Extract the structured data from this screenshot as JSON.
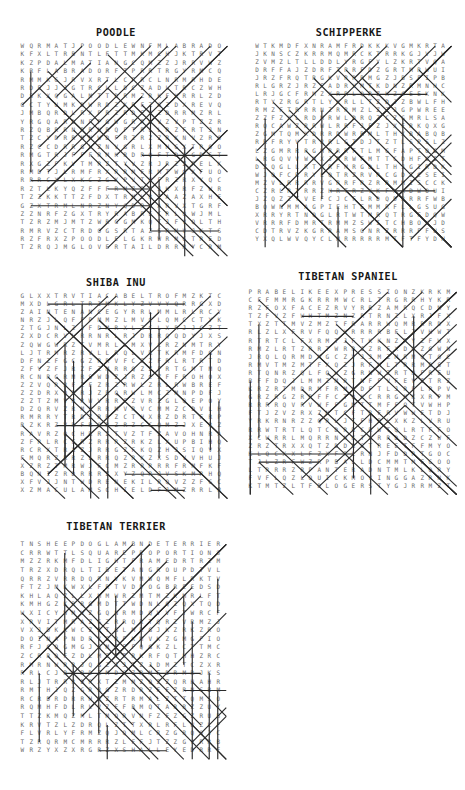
{
  "page": {
    "width": 465,
    "height": 790,
    "background": "#ffffff",
    "kind": "word-search-puzzle-sheet",
    "ink_color": "#2b2b2b",
    "letter_color": "#6a6a6a"
  },
  "puzzles": [
    {
      "id": "poodle",
      "title": "POODLE",
      "x": 8,
      "y": 26,
      "title_width": 216,
      "grid": {
        "left": 10,
        "top": 16,
        "cols": 24,
        "rows": 25,
        "cell_w": 8.55,
        "cell_h": 8.4
      },
      "letters": [
        "WQRMATJPOODLEWNFMLABRADOEXX",
        "KFXLTRBNTLFTTMKMCHJKTRVTAR",
        "KZPDALMATIANGCQMZZJRRVWZ",
        "KRFLABRADORFTPRRTRGYRMCQH",
        "RMMKGJRVXRTLCFRCLNRMRHD",
        "RDEJJJGTRCLLDCZADLTRCZWH",
        "DSKXQGALMTTDRMZRKFKRRLZD",
        "GCTYUMKDWRDZKRFZGZDXR",
        "JMBQRDLRXPRZRDFXZDRRMZR",
        "YRGQARDNFPGWGRRWVZVPTZZR",
        "RZQBRRNRRNRQFTRLLRZFRT",
        "TZCYDRRMNWDFRZRZZRKNVZR",
        "RZCCDRRGLZNVGRLXMHGXTR",
        "RMGTRJFFFRMKRDRQFTDJGDST",
        "RXGZFKVTMRZTYVZRJRZZ",
        "RMDTJLRMFRXRRMFRMTWGX",
        "RRRCXLXKCZGXPVTHFRZRX",
        "RZTLKYQZFFFRMZRTJKXRFZWR",
        "TZZKKTTZFDXTRMLRZAAZAXH",
        "GZXTRMLNRZNYQDRGARVXTGR",
        "ZZNRFZGXTRYRABRECRLQWJM",
        "TZRZMJMTZWRGGMKQTJFVQLT",
        "RMRVZCTRDOGSRTAZSRMVJ",
        "RZFRXZPOODLELGKRWRMGTR",
        "TZRQJMGLOVERTAILDRRRYCRMJ",
        "RJRVZZGRRRFOODDLRNDZTRAXR"
      ],
      "line_count": 39
    },
    {
      "id": "schipperke",
      "title": "SCHIPPERKE",
      "x": 245,
      "y": 26,
      "title_width": 208,
      "grid": {
        "left": 8,
        "top": 16,
        "cols": 24,
        "rows": 25,
        "cell_w": 8.1,
        "cell_h": 8.05
      },
      "letters": [
        "WTKMDFXNRAMFRDKKKVGMKRTAFJ",
        "JKNSCZKRRMQMRCKTRRKGJ",
        "ZVMZLTLLDDLYRGFYLZKRT",
        "DRFFAJZDRFTRRFDZGRTMR",
        "JRZFRQTRGKVRRRMGZJB",
        "RLGRZJRZFADRVMTKDNZRM",
        "LRJGCFRMZXRRLQRZKZ",
        "RTYZRGRTLYKRLLTZDJ",
        "RMZFTRRRNZRRMZLZZJG",
        "ZZFZXLRDMRWLDRQZCZ",
        "RQCAWZRRWLRRFJFZJXFR",
        "ZGMTQMXDRRDWRRMLTH",
        "RRFRYVTRRRLGTDJTZT",
        "LZGMRRRGMRRRFTLMG",
        "LRGQVVWMXJRRWFMTTCDHFG",
        "DZQGLLRTRRFMRGDLTHJG",
        "WJQFCRRYLQTRZRVRCGD",
        "MZVLRRRRVGRRFRZRRMM",
        "CZRLRTRRZHRTRZYKFXA",
        "JZQZZTVEFCJCFLRDQDRR",
        "BQWNMMAGPIEHTEMMRFLLG",
        "XRRYRTNQGLRTWTMRQTRGFD",
        "VRRRFDMRTRMMZSWITCHBOXJDRT",
        "CDTRVZKGRRAMSONRZRRRFF",
        "YXQLWVQYCLMRRRRRMTFTFY"
      ],
      "line_count": 36
    },
    {
      "id": "shiba-inu",
      "title": "SHIBA INU",
      "x": 8,
      "y": 276,
      "title_width": 216,
      "grid": {
        "left": 10,
        "top": 16,
        "cols": 24,
        "rows": 25,
        "cell_w": 8.55,
        "cell_h": 8.1
      },
      "letters": [
        "GLXXTRVTIACABELTROFMZKTCZW",
        "MXDLGRLTRIMKLYZVVYQRRGXDL",
        "ZAINTENANCEGYRRLMMLRLRCYFR",
        "NRZJLQFFPMMZLMVCLQMCCTYKDM",
        "ZTGJNLZJFDMRXLZCLXRJJCZT",
        "ZXDCRVLRRNRLRJDRRQQDYJX",
        "ZQWGWRZTVMRLLMXVCRZNMTR",
        "LJTRMRZRVLLRQLVRTKRMFDG",
        "DFNZFGCGZRRVFCZZFRLRTR",
        "ZFVZFJRZFZMRRQZZFRTGMT",
        "RCNRGRMRSWDZJRZCZFFR",
        "ZZVQRRFZFZRZRWLZRLR",
        "ZZDRXQRRJZRQRWLMCZM",
        "ZZTZMVRRWVRRFZVRZGLQ",
        "DZQRVZRMVRRMVRVCMMZC",
        "RMRRYTRDZRRZCTHXRZDRT",
        "RZKRZVRFRQRZRZCCQMZJX",
        "RAVRZQCHRRZTVZTFZ",
        "ZFRLRCFRZRRRZRKZ",
        "RCRXTRXZJRRGZFKQ",
        "FMQRZRRZLRRQZRKZX",
        "XZRZTMRWJFCMZRRRRRFR",
        "BQNIZRDRRRZXYZQRJ",
        "XFVJJNTWDRENEKILRQVZZF",
        "XZMACULAMSCHIELDFJMZRRL"
      ],
      "line_count": 40
    },
    {
      "id": "tibetan-spaniel",
      "title": "TIBETAN SPANIEL",
      "x": 240,
      "y": 270,
      "title_width": 216,
      "grid": {
        "left": 6,
        "top": 18,
        "cols": 24,
        "rows": 25,
        "cell_w": 8.6,
        "cell_h": 8.1
      },
      "letters": [
        "PRABELIKEEXPRESSIONZKRKMKD",
        "CFFMMRGKRRMWCRLTRGRRHYKRE",
        "RZFOXFACEZRVYRRZAMRQC",
        "TZFVZFWHTMZNZRTRNZLXRJ",
        "TXZTTMVZMZTFRARRWQMRRRD",
        "RLZLXFRVFQQXRRRRBFLZV",
        "RTRTCLFXRMTJFTKKNZR",
        "RMZLRTZRRTWRRJZRFXDCZ",
        "JRQLQRMDMGCZVJJMZMRM",
        "RMVTMZMTFXQZJRFMLTRRM",
        "RTQNRZQLFQWZGRNWZRTHFR",
        "BFFDQJLMMZMRTNFFVF",
        "KRZRTMDRMFRMLDFTLJR",
        "GRZRGZRRFFCTQKCRRGMKXR",
        "RRRRQVRVWFFGMTTMFFQTVW",
        "FTJZVZRXZNTCFTRFRVW",
        "YRKRNRZZQRLJTFHRLXKZLVR",
        "RRWTRTLQTCDRRCRWTQLRTFF",
        "XCWRRLMQRRNNKTLRRDDZCZW",
        "ZRZTRXXQTZDDRSTREETFF",
        "KLQCXXLFZXFRLRNJFDDRTG",
        "TJLZRFWZRPBALLDCMMTMFG",
        "LTRRRZRPANTERADNTMLKLQRY",
        "FVFLQZLQUICKMOVINGGAZRNKG",
        "KTMTZLTFDLOGERSTYGJRRMZT"
      ],
      "line_count": 41
    },
    {
      "id": "tibetan-terrier",
      "title": "TIBETAN TERRIER",
      "x": 8,
      "y": 520,
      "title_width": 216,
      "grid": {
        "left": 10,
        "top": 20,
        "cols": 24,
        "rows": 25,
        "cell_w": 8.5,
        "cell_h": 8.6
      },
      "letters": [
        "TNSHEEPDOGLAMBNDETERRIERTLIMAFN",
        "CRRWTTLSQUAREPROPORTIONSDWF",
        "MZZRKMFDLIGHTFRAMEDRTRZMF",
        "TRZXDRQLTIBETANGROUPDTVLDTX",
        "QRRZVRRDQRNVKVMWQMFLRKTVTKF",
        "FTZJMKWXLFRTVDDOGBREEDSDCZ",
        "KHLAQZLLXMMWRZMTMZKMRLFTG",
        "KMHGZKRRGMDTTWDNLQZQXTQD",
        "WXICYWMVZGQNRMDQVVFTWRCF",
        "XRVITMRAZGZRRQRTQRZVRM",
        "VXJDKKWCZRTGLMRGJKZRKZR",
        "DOINAPNDRYZRFKMVKZGMGF",
        "RFJCQGMGJGMFFFQGKZLCTT",
        "ZCRRQFZDLMZTTRKRFQTH",
        "RMRNWRRJQGZJJTZJDMZTCZX",
        "RRLCJRQBDZMDGZRMFDRMRJ",
        "RLJTRRRDRXTZMMZQZZQRH",
        "RMTHJQZGRRGZRDRZFFZR",
        "RCRDRDRRHRZRTRMALZTTQM",
        "RQMHFDLRLVZFFRMQTARRZZ",
        "TTZKMQZMLTMQRVNFZFZGZR",
        "KRVTZLZDRQLZTTXRLRFLWZ",
        "FLVRLYFRMZQJQMLCRZGRQQ",
        "TZRQRMCMRRRZLFFJTZZGVRR",
        "WRZYXZXRGRZXSHALLEYEDRRF",
        "KZAMBERTONGSTERRIERQRMLDVR"
      ],
      "line_count": 44
    }
  ]
}
